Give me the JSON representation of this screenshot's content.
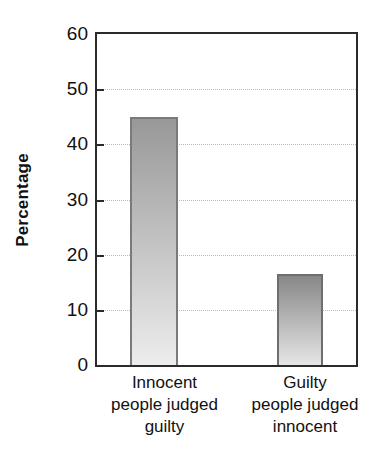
{
  "chart_data": {
    "type": "bar",
    "title": "",
    "subtitle": "",
    "xlabel": "",
    "ylabel": "Percentage",
    "ylim": [
      0,
      60
    ],
    "ytick_values": [
      60,
      50,
      40,
      30,
      20,
      10,
      0
    ],
    "ytick_labels": [
      "60",
      "50",
      "40",
      "30",
      "20",
      "10",
      "0"
    ],
    "grid": "horizontal-dotted",
    "legend": "none",
    "categories": [
      "Innocent people judged guilty",
      "Guilty people judged innocent"
    ],
    "category_label_lines": [
      [
        "Innocent",
        "people judged",
        "guilty"
      ],
      [
        "Guilty",
        "people judged",
        "innocent"
      ]
    ],
    "values": [
      45,
      16.5
    ],
    "bars": [
      {
        "label": "Innocent people judged guilty",
        "value": 45,
        "gradient_top_color": "#989898",
        "gradient_bottom_color": "#ededed",
        "edge_color": "#7a7a7a"
      },
      {
        "label": "Guilty people judged innocent",
        "value": 16.5,
        "gradient_top_color": "#878787",
        "gradient_bottom_color": "#e6e6e6",
        "edge_color": "#6e6e6e"
      }
    ],
    "axis_color": "#2b2b2b",
    "grid_color": "#b9b9b9",
    "background_color": "#ffffff"
  }
}
